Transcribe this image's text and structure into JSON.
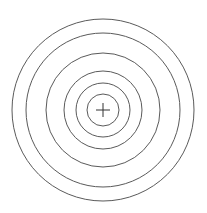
{
  "diagram": {
    "type": "concentric-circles",
    "background": "#ffffff",
    "stroke_color": "#5a5a5a",
    "center": {
      "x": 103,
      "y": 110
    },
    "radii": [
      91,
      77,
      57,
      39,
      27,
      16
    ],
    "center_mark": {
      "type": "cross",
      "size": 7
    }
  }
}
